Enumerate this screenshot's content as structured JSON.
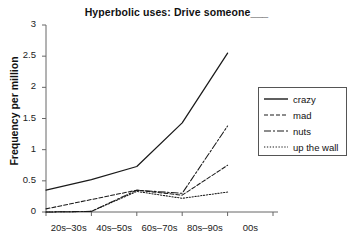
{
  "chart_data": {
    "type": "line",
    "title": "Hyperbolic uses: Drive someone___",
    "xlabel": "",
    "ylabel": "Frequency per million",
    "categories": [
      "20s–30s",
      "40s–50s",
      "60s–70s",
      "80s–90s",
      "00s"
    ],
    "x_tick_values": [
      0,
      1,
      2,
      3,
      4,
      5
    ],
    "y_tick_labels": [
      "0",
      "0.5",
      "1",
      "1.5",
      "2",
      "2.5",
      "3"
    ],
    "ylim": [
      0,
      3
    ],
    "xlim": [
      0,
      5
    ],
    "grid": false,
    "legend_position": "right",
    "series": [
      {
        "name": "crazy",
        "style": "solid",
        "values": [
          0.35,
          0.52,
          0.73,
          1.43,
          2.55
        ]
      },
      {
        "name": "mad",
        "style": "dashed",
        "values": [
          0.05,
          0.2,
          0.35,
          0.27,
          0.75
        ]
      },
      {
        "name": "nuts",
        "style": "dash-dot",
        "values": [
          0.0,
          0.01,
          0.35,
          0.3,
          1.38
        ]
      },
      {
        "name": "up the wall",
        "style": "dotted",
        "values": [
          0.0,
          0.01,
          0.33,
          0.22,
          0.32
        ]
      }
    ]
  },
  "axes": {
    "y_ticks": [
      {
        "label": "3",
        "value": 3
      },
      {
        "label": "2.5",
        "value": 2.5
      },
      {
        "label": "2",
        "value": 2
      },
      {
        "label": "1.5",
        "value": 1.5
      },
      {
        "label": "1",
        "value": 1
      },
      {
        "label": "0.5",
        "value": 0.5
      },
      {
        "label": "0",
        "value": 0
      }
    ],
    "x_ticks": [
      {
        "label": "20s–30s"
      },
      {
        "label": "40s–50s"
      },
      {
        "label": "60s–70s"
      },
      {
        "label": "80s–90s"
      },
      {
        "label": "00s"
      }
    ]
  },
  "legend": {
    "items": [
      {
        "label": "crazy",
        "style": "solid"
      },
      {
        "label": "mad",
        "style": "dashed"
      },
      {
        "label": "nuts",
        "style": "dash-dot"
      },
      {
        "label": "up the wall",
        "style": "dotted"
      }
    ]
  },
  "colors": {
    "line": "#1a1a1a",
    "axis": "#666666",
    "text": "#111111",
    "background": "#ffffff"
  }
}
